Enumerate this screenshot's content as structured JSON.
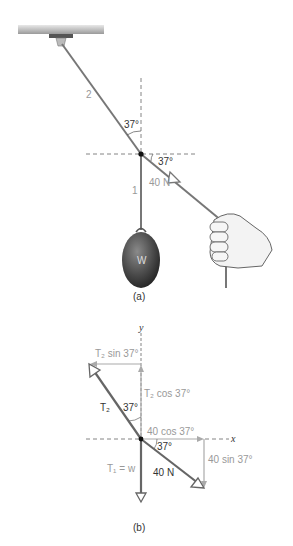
{
  "figure_a": {
    "caption": "(a)",
    "rope_2_label": "2",
    "rope_1_label": "1",
    "angle_vertical": "37°",
    "angle_horizontal": "37°",
    "force_label": "40 N",
    "weight_label": "W"
  },
  "figure_b": {
    "caption": "(b)",
    "y_axis": "y",
    "x_axis": "x",
    "t2_sin": "T₂ sin 37°",
    "t2_cos": "T₂ cos 37°",
    "t2": "T₂",
    "angle_vertical": "37°",
    "angle_horizontal": "37°",
    "cos40": "40 cos 37°",
    "sin40": "40 sin 37°",
    "force_label": "40 N",
    "t1": "T₁ = w"
  },
  "colors": {
    "rope": "#666666",
    "component": "#aaaaaa",
    "weight": "#4a4a4a"
  }
}
